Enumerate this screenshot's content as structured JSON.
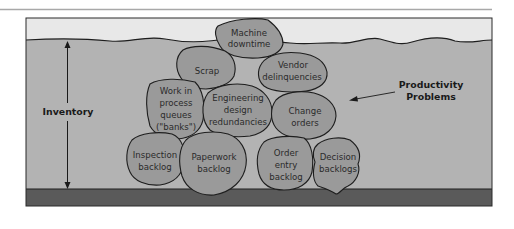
{
  "diagram": {
    "colors": {
      "top_rule": "#a8a8a8",
      "sky": "#e8e8e8",
      "water": "#b3b3b3",
      "ground": "#5a5a5a",
      "rock_fill": "#9a9a9a",
      "outline": "#1e1e1e"
    },
    "labels": {
      "inventory": "Inventory",
      "problems_line1": "Productivity",
      "problems_line2": "Problems"
    },
    "rocks": [
      {
        "id": "machine-downtime",
        "lines": [
          "Machine",
          "downtime"
        ]
      },
      {
        "id": "scrap",
        "lines": [
          "Scrap"
        ]
      },
      {
        "id": "vendor-delinquencies",
        "lines": [
          "Vendor",
          "delinquencies"
        ]
      },
      {
        "id": "work-in-process",
        "lines": [
          "Work in",
          "process",
          "queues",
          "(\"banks\")"
        ]
      },
      {
        "id": "engineering-design",
        "lines": [
          "Engineering",
          "design",
          "redundancies"
        ]
      },
      {
        "id": "change-orders",
        "lines": [
          "Change",
          "orders"
        ]
      },
      {
        "id": "inspection-backlog",
        "lines": [
          "Inspection",
          "backlog"
        ]
      },
      {
        "id": "paperwork-backlog",
        "lines": [
          "Paperwork",
          "backlog"
        ]
      },
      {
        "id": "order-entry-backlog",
        "lines": [
          "Order",
          "entry",
          "backlog"
        ]
      },
      {
        "id": "decision-backlogs",
        "lines": [
          "Decision",
          "backlogs"
        ]
      }
    ]
  }
}
